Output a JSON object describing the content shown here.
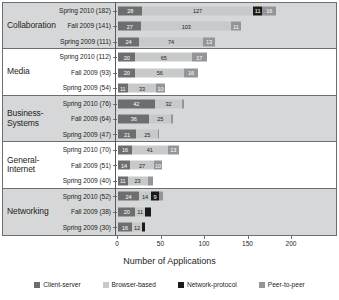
{
  "chart_data": {
    "type": "bar",
    "orientation": "horizontal",
    "stacked": true,
    "title": "",
    "xlabel": "Number of Applications",
    "ylabel": "",
    "xlim": [
      0,
      200
    ],
    "xticks": [
      0,
      50,
      100,
      150,
      200
    ],
    "grid": false,
    "legend_position": "bottom",
    "series": [
      {
        "name": "Client-server",
        "key": "cs",
        "color": "#6d6e70"
      },
      {
        "name": "Browser-based",
        "key": "bb",
        "color": "#c8c9ca"
      },
      {
        "name": "Network-protocol",
        "key": "np",
        "color": "#1a1a1a"
      },
      {
        "name": "Peer-to-peer",
        "key": "p2p",
        "color": "#939598"
      }
    ],
    "groups": [
      {
        "name": "Collaboration",
        "shaded": true,
        "rows": [
          {
            "label": "Spring  2010 (182)",
            "period": "Spring 2010",
            "total": 182,
            "values": {
              "cs": 28,
              "bb": 127,
              "np": 11,
              "p2p": 16
            }
          },
          {
            "label": "Fall  2009 (141)",
            "period": "Fall 2009",
            "total": 141,
            "values": {
              "cs": 27,
              "bb": 103,
              "np": 0,
              "p2p": 11
            }
          },
          {
            "label": "Spring  2009 (111)",
            "period": "Spring 2009",
            "total": 111,
            "values": {
              "cs": 24,
              "bb": 74,
              "np": 0,
              "p2p": 13
            }
          }
        ]
      },
      {
        "name": "Media",
        "shaded": false,
        "rows": [
          {
            "label": "Spring  2010 (112)",
            "period": "Spring 2010",
            "total": 112,
            "values": {
              "cs": 20,
              "bb": 65,
              "np": 0,
              "p2p": 17
            }
          },
          {
            "label": "Fall  2009  (93)",
            "period": "Fall 2009",
            "total": 93,
            "values": {
              "cs": 20,
              "bb": 56,
              "np": 0,
              "p2p": 16
            }
          },
          {
            "label": "Spring  2009  (54)",
            "period": "Spring 2009",
            "total": 54,
            "values": {
              "cs": 11,
              "bb": 33,
              "np": 0,
              "p2p": 10
            }
          }
        ]
      },
      {
        "name": "Business-\nSystems",
        "shaded": true,
        "rows": [
          {
            "label": "Spring  2010  (76)",
            "period": "Spring 2010",
            "total": 76,
            "values": {
              "cs": 42,
              "bb": 32,
              "np": 0,
              "p2p": 2
            }
          },
          {
            "label": "Fall  2009  (64)",
            "period": "Fall 2009",
            "total": 64,
            "values": {
              "cs": 36,
              "bb": 25,
              "np": 0,
              "p2p": 2
            }
          },
          {
            "label": "Spring  2009  (47)",
            "period": "Spring 2009",
            "total": 47,
            "values": {
              "cs": 21,
              "bb": 25,
              "np": 0,
              "p2p": 1
            }
          }
        ]
      },
      {
        "name": "General-\nInternet",
        "shaded": false,
        "rows": [
          {
            "label": "Spring  2010  (70)",
            "period": "Spring 2010",
            "total": 70,
            "values": {
              "cs": 16,
              "bb": 41,
              "np": 0,
              "p2p": 13
            }
          },
          {
            "label": "Fall  2009  (51)",
            "period": "Fall 2009",
            "total": 51,
            "values": {
              "cs": 14,
              "bb": 27,
              "np": 0,
              "p2p": 10
            }
          },
          {
            "label": "Spring  2009  (40)",
            "period": "Spring 2009",
            "total": 40,
            "values": {
              "cs": 11,
              "bb": 23,
              "np": 0,
              "p2p": 6
            }
          }
        ]
      },
      {
        "name": "Networking",
        "shaded": true,
        "rows": [
          {
            "label": "Spring  2010  (52)",
            "period": "Spring 2010",
            "total": 52,
            "values": {
              "cs": 24,
              "bb": 14,
              "np": 9,
              "p2p": 5
            }
          },
          {
            "label": "Fall  2009  (38)",
            "period": "Fall 2009",
            "total": 38,
            "values": {
              "cs": 20,
              "bb": 11,
              "np": 7,
              "p2p": 0
            }
          },
          {
            "label": "Spring  2009  (30)",
            "period": "Spring 2009",
            "total": 30,
            "values": {
              "cs": 16,
              "bb": 12,
              "np": 3,
              "p2p": 0
            }
          }
        ]
      }
    ]
  }
}
